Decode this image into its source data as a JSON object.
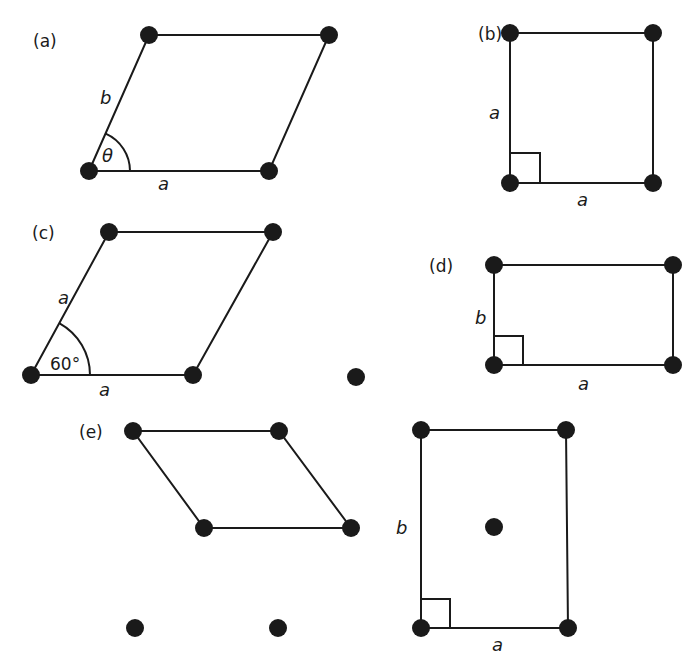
{
  "panels": [
    {
      "id": "a",
      "label": "(a)",
      "name": "oblique",
      "points": [
        [
          89,
          171
        ],
        [
          149,
          35
        ],
        [
          329,
          35
        ],
        [
          269,
          171
        ]
      ],
      "cell": [
        [
          89,
          171
        ],
        [
          149,
          35
        ],
        [
          329,
          35
        ],
        [
          269,
          171
        ]
      ],
      "edge_labels": [
        {
          "text": "b",
          "x": 100,
          "y": 104
        },
        {
          "text": "a",
          "x": 158,
          "y": 190
        }
      ],
      "angle_label": {
        "text": "θ",
        "x": 102,
        "y": 162
      },
      "angle_arc": {
        "cx": 89,
        "cy": 171,
        "r": 41,
        "from_deg": 0,
        "to_deg": 66
      }
    },
    {
      "id": "b",
      "label": "(b)",
      "name": "square",
      "points": [
        [
          510,
          33
        ],
        [
          653,
          33
        ],
        [
          510,
          183
        ],
        [
          653,
          183
        ]
      ],
      "cell": [
        [
          510,
          183
        ],
        [
          510,
          33
        ],
        [
          653,
          33
        ],
        [
          653,
          183
        ]
      ],
      "edge_labels": [
        {
          "text": "a",
          "x": 489,
          "y": 119
        },
        {
          "text": "a",
          "x": 577,
          "y": 206
        }
      ],
      "right_angle": {
        "x": 510,
        "y": 183,
        "size": 30
      }
    },
    {
      "id": "c",
      "label": "(c)",
      "name": "hexagonal",
      "points": [
        [
          31,
          375
        ],
        [
          109,
          232
        ],
        [
          273,
          232
        ],
        [
          193,
          375
        ],
        [
          356,
          377
        ]
      ],
      "cell": [
        [
          31,
          375
        ],
        [
          109,
          232
        ],
        [
          273,
          232
        ],
        [
          193,
          375
        ]
      ],
      "edge_labels": [
        {
          "text": "a",
          "x": 58,
          "y": 304
        },
        {
          "text": "a",
          "x": 99,
          "y": 396
        }
      ],
      "angle_label": {
        "text": "60°",
        "x": 50,
        "y": 370
      },
      "angle_arc": {
        "cx": 31,
        "cy": 375,
        "r": 59,
        "from_deg": 0,
        "to_deg": 61
      }
    },
    {
      "id": "d",
      "label": "(d)",
      "name": "rectangular",
      "points": [
        [
          494,
          265
        ],
        [
          673,
          265
        ],
        [
          494,
          365
        ],
        [
          673,
          365
        ]
      ],
      "cell": [
        [
          494,
          365
        ],
        [
          494,
          265
        ],
        [
          673,
          265
        ],
        [
          673,
          365
        ]
      ],
      "edge_labels": [
        {
          "text": "b",
          "x": 475,
          "y": 324
        },
        {
          "text": "a",
          "x": 578,
          "y": 390
        }
      ],
      "right_angle": {
        "x": 494,
        "y": 365,
        "size": 29
      }
    },
    {
      "id": "e",
      "label": "(e)",
      "name": "centered-rectangular",
      "points": [
        [
          133,
          431
        ],
        [
          279,
          431
        ],
        [
          204,
          528
        ],
        [
          351,
          528
        ],
        [
          135,
          628
        ],
        [
          278,
          628
        ],
        [
          421,
          430
        ],
        [
          566,
          430
        ],
        [
          494,
          527
        ],
        [
          421,
          628
        ],
        [
          568,
          628
        ]
      ],
      "cell": [
        [
          133,
          431
        ],
        [
          279,
          431
        ],
        [
          351,
          528
        ],
        [
          204,
          528
        ]
      ],
      "conventional_cell": [
        [
          421,
          628
        ],
        [
          421,
          430
        ],
        [
          566,
          430
        ],
        [
          568,
          628
        ]
      ],
      "edge_labels": [
        {
          "text": "b",
          "x": 396,
          "y": 534
        },
        {
          "text": "a",
          "x": 492,
          "y": 651
        }
      ],
      "right_angle": {
        "x": 421,
        "y": 628,
        "size": 29
      }
    }
  ],
  "colors": {
    "ink": "#1a1a1a",
    "background": "#ffffff"
  }
}
